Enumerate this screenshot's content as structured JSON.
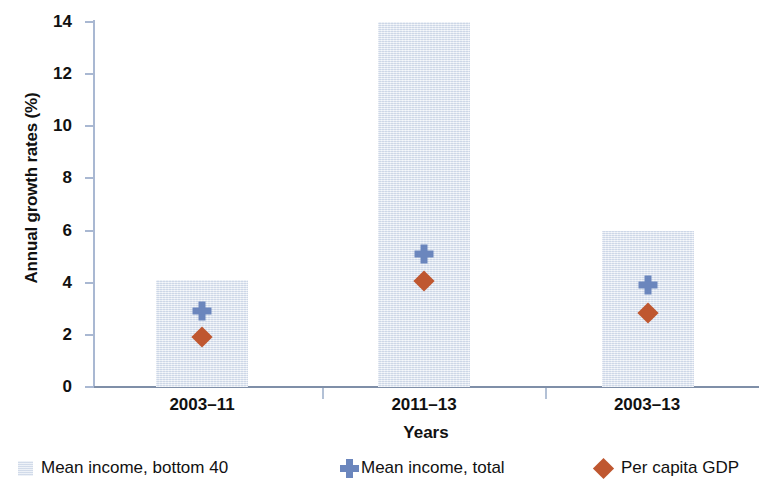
{
  "chart_data": {
    "type": "bar",
    "title": "",
    "xlabel": "Years",
    "ylabel": "Annual growth rates (%)",
    "categories": [
      "2003–11",
      "2011–13",
      "2003–13"
    ],
    "ylim": [
      0,
      14
    ],
    "yticks": [
      0,
      2,
      4,
      6,
      8,
      10,
      12,
      14
    ],
    "ytick_labels": [
      "0",
      "2",
      "4",
      "6",
      "8",
      "10",
      "12",
      "14"
    ],
    "grid": false,
    "legend_position": "bottom",
    "series": [
      {
        "name": "Mean income, bottom 40",
        "marker": "bar",
        "color": "#dce4f0",
        "values": [
          4.1,
          14.0,
          6.0
        ]
      },
      {
        "name": "Mean income, total",
        "marker": "cross",
        "color": "#6b86bd",
        "values": [
          2.9,
          5.1,
          3.9
        ]
      },
      {
        "name": "Per capita GDP",
        "marker": "diamond",
        "color": "#bf5730",
        "values": [
          1.9,
          4.05,
          2.85
        ]
      }
    ]
  },
  "axis": {
    "y_title": "Annual growth rates (%)",
    "x_title": "Years",
    "y_ticks": [
      "14",
      "12",
      "10",
      "8",
      "6",
      "4",
      "2",
      "0"
    ],
    "x_ticks": [
      "2003–11",
      "2011–13",
      "2003–13"
    ]
  },
  "legend": {
    "items": [
      {
        "label": "Mean income, bottom 40",
        "icon": "square-swatch-icon",
        "color": "#dce4f0"
      },
      {
        "label": "Mean income, total",
        "icon": "cross-marker-icon",
        "color": "#6b86bd"
      },
      {
        "label": "Per capita GDP",
        "icon": "diamond-marker-icon",
        "color": "#bf5730"
      }
    ]
  }
}
